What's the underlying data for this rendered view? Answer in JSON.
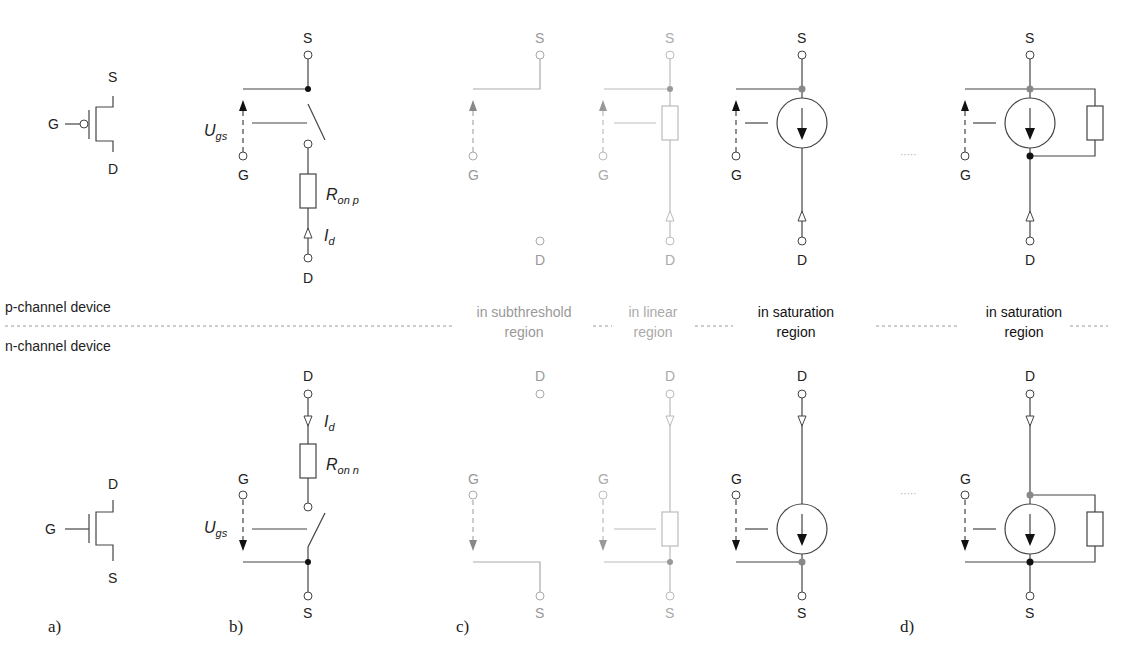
{
  "rows": {
    "p_channel_label": "p-channel device",
    "n_channel_label": "n-channel device"
  },
  "terminals": {
    "source": "S",
    "drain": "D",
    "gate": "G"
  },
  "symbols": {
    "ugs": "U",
    "ugs_sub": "gs",
    "id": "I",
    "id_sub": "d",
    "ron_p": "R",
    "ron_p_sub": "on p",
    "ron_n": "R",
    "ron_n_sub": "on n"
  },
  "regions": [
    {
      "line1": "in subthreshold",
      "line2": "region",
      "color": "#999999"
    },
    {
      "line1": "in linear",
      "line2": "region",
      "color": "#aaaaaa"
    },
    {
      "line1": "in saturation",
      "line2": "region",
      "color": "#111111"
    },
    {
      "line1": "in saturation",
      "line2": "region",
      "color": "#111111"
    }
  ],
  "panel_captions": [
    "a)",
    "b)",
    "c)",
    "d)"
  ],
  "continuation_marks": "·····",
  "colors": {
    "wire": "#444444",
    "faint_wire": "#aaaaaa",
    "node_gray": "#888888",
    "node_black": "#111111"
  }
}
